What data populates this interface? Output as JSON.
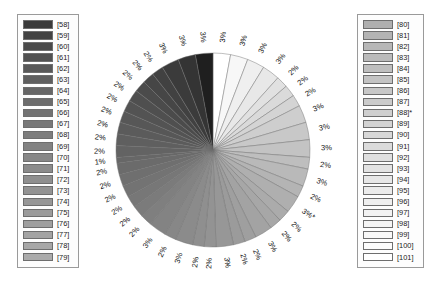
{
  "chart_data": {
    "type": "pie",
    "title": "",
    "subtitle": "",
    "xlabel": "",
    "ylabel": "",
    "legend_position": "left-and-right",
    "grid": false,
    "start_angle_deg": 0,
    "direction": "clockwise",
    "center": {
      "x": 213,
      "y": 150
    },
    "radius": 97,
    "label_note": "Percentages are rendered radially just outside the pie edge.",
    "categories": [
      "[101]",
      "[100]",
      "[99]",
      "[98]",
      "[97]",
      "[96]",
      "[95]",
      "[94]",
      "[93]",
      "[92]",
      "[91]",
      "[90]",
      "[89]",
      "[88]*",
      "[87]",
      "[86]",
      "[85]",
      "[84]",
      "[83]",
      "[82]",
      "[81]",
      "[80]",
      "[79]",
      "[78]",
      "[77]",
      "[76]",
      "[75]",
      "[74]",
      "[73]",
      "[72]",
      "[71]",
      "[70]",
      "[69]",
      "[68]",
      "[67]",
      "[66]",
      "[65]",
      "[64]",
      "[63]",
      "[62]",
      "[61]",
      "[60]",
      "[59]",
      "[58]"
    ],
    "values": [
      3,
      3,
      3,
      3,
      2,
      2,
      2,
      3,
      3,
      3,
      2,
      3,
      2,
      3,
      2,
      2,
      3,
      2,
      2,
      3,
      2,
      2,
      3,
      2,
      3,
      2,
      2,
      2,
      2,
      2,
      2,
      1,
      2,
      2,
      2,
      2,
      2,
      2,
      2,
      2,
      2,
      3,
      3,
      3
    ],
    "labels": [
      "3%",
      "3%",
      "3%",
      "3%",
      "2%",
      "2%",
      "2%",
      "3%",
      "3%",
      "3%",
      "2%",
      "3%",
      "2%",
      "3%*",
      "2%",
      "2%",
      "3%",
      "2%",
      "2%",
      "3%",
      "2%",
      "2%",
      "3%",
      "2%",
      "3%",
      "2%",
      "2%",
      "2%",
      "2%",
      "2%",
      "2%",
      "1%",
      "2%",
      "2%",
      "2%",
      "2%",
      "2%",
      "2%",
      "2%",
      "2%",
      "2%",
      "3%",
      "3%",
      "3%"
    ],
    "colors": [
      "#ffffff",
      "#f7f7f7",
      "#efefef",
      "#e8e8e8",
      "#e1e1e1",
      "#dadada",
      "#d4d4d4",
      "#cecece",
      "#c8c8c8",
      "#c3c3c3",
      "#bebebe",
      "#b9b9b9",
      "#b4b4b4",
      "#afafaf",
      "#ababab",
      "#a7a7a7",
      "#a3a3a3",
      "#9f9f9f",
      "#9b9b9b",
      "#979797",
      "#939393",
      "#8f8f8f",
      "#8b8b8b",
      "#878787",
      "#838383",
      "#7f7f7f",
      "#7b7b7b",
      "#777777",
      "#737373",
      "#6f6f6f",
      "#6b6b6b",
      "#676767",
      "#636363",
      "#5f5f5f",
      "#5b5b5b",
      "#575757",
      "#535353",
      "#4f4f4f",
      "#4b4b4b",
      "#464646",
      "#414141",
      "#3b3b3b",
      "#343434",
      "#1f1f1f"
    ]
  },
  "legend_left": {
    "items": [
      {
        "label": "[58]",
        "color": "#3a3a3a"
      },
      {
        "label": "[59]",
        "color": "#434343"
      },
      {
        "label": "[60]",
        "color": "#4a4a4a"
      },
      {
        "label": "[61]",
        "color": "#515151"
      },
      {
        "label": "[62]",
        "color": "#585858"
      },
      {
        "label": "[63]",
        "color": "#5f5f5f"
      },
      {
        "label": "[64]",
        "color": "#666666"
      },
      {
        "label": "[65]",
        "color": "#6c6c6c"
      },
      {
        "label": "[66]",
        "color": "#727272"
      },
      {
        "label": "[67]",
        "color": "#787878"
      },
      {
        "label": "[68]",
        "color": "#7d7d7d"
      },
      {
        "label": "[69]",
        "color": "#828282"
      },
      {
        "label": "[70]",
        "color": "#878787"
      },
      {
        "label": "[71]",
        "color": "#8b8b8b"
      },
      {
        "label": "[72]",
        "color": "#8f8f8f"
      },
      {
        "label": "[73]",
        "color": "#939393"
      },
      {
        "label": "[74]",
        "color": "#979797"
      },
      {
        "label": "[75]",
        "color": "#9b9b9b"
      },
      {
        "label": "[76]",
        "color": "#9f9f9f"
      },
      {
        "label": "[77]",
        "color": "#a3a3a3"
      },
      {
        "label": "[78]",
        "color": "#a7a7a7"
      },
      {
        "label": "[79]",
        "color": "#ababab"
      }
    ]
  },
  "legend_right": {
    "items": [
      {
        "label": "[80]",
        "color": "#afafaf"
      },
      {
        "label": "[81]",
        "color": "#b3b3b3"
      },
      {
        "label": "[82]",
        "color": "#b7b7b7"
      },
      {
        "label": "[83]",
        "color": "#bbbbbb"
      },
      {
        "label": "[84]",
        "color": "#bfbfbf"
      },
      {
        "label": "[85]",
        "color": "#c3c3c3"
      },
      {
        "label": "[86]",
        "color": "#c7c7c7"
      },
      {
        "label": "[87]",
        "color": "#cbcbcb"
      },
      {
        "label": "[88]*",
        "color": "#cfcfcf"
      },
      {
        "label": "[89]",
        "color": "#d3d3d3"
      },
      {
        "label": "[90]",
        "color": "#d7d7d7"
      },
      {
        "label": "[91]",
        "color": "#dbdbdb"
      },
      {
        "label": "[92]",
        "color": "#dfdfdf"
      },
      {
        "label": "[93]",
        "color": "#e3e3e3"
      },
      {
        "label": "[94]",
        "color": "#e7e7e7"
      },
      {
        "label": "[95]",
        "color": "#ebebeb"
      },
      {
        "label": "[96]",
        "color": "#efefef"
      },
      {
        "label": "[97]",
        "color": "#f2f2f2"
      },
      {
        "label": "[98]",
        "color": "#f5f5f5"
      },
      {
        "label": "[99]",
        "color": "#f8f8f8"
      },
      {
        "label": "[100]",
        "color": "#fcfcfc"
      },
      {
        "label": "[101]",
        "color": "#ffffff"
      }
    ]
  }
}
